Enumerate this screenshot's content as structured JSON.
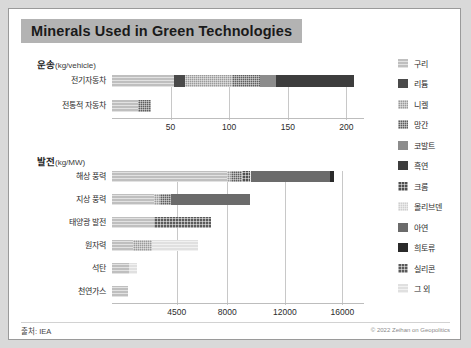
{
  "title": "Minerals Used in Green Technologies",
  "source": "출처: IEA",
  "copyright": "© 2022 Zeihan on Geopolitics",
  "legend": {
    "items": [
      {
        "label": "구리",
        "color": "#bfbfbf",
        "pattern": "hlines"
      },
      {
        "label": "리튬",
        "color": "#4a4a4a",
        "pattern": "solid"
      },
      {
        "label": "니켈",
        "color": "#9a9a9a",
        "pattern": "dots"
      },
      {
        "label": "망간",
        "color": "#5e5e5e",
        "pattern": "dots"
      },
      {
        "label": "코발트",
        "color": "#8c8c8c",
        "pattern": "solid"
      },
      {
        "label": "흑연",
        "color": "#3d3d3d",
        "pattern": "solid"
      },
      {
        "label": "크롬",
        "color": "#4f4f4f",
        "pattern": "checks"
      },
      {
        "label": "몰리브덴",
        "color": "#cfcfcf",
        "pattern": "dots"
      },
      {
        "label": "아연",
        "color": "#6b6b6b",
        "pattern": "solid"
      },
      {
        "label": "희토류",
        "color": "#2a2a2a",
        "pattern": "solid"
      },
      {
        "label": "실리콘",
        "color": "#5a5a5a",
        "pattern": "checks"
      },
      {
        "label": "그 외",
        "color": "#e0e0e0",
        "pattern": "hlines"
      }
    ]
  },
  "chart_data": [
    {
      "type": "bar",
      "orientation": "horizontal",
      "stacked": true,
      "title": "운송",
      "unit": "(kg/vehicle)",
      "xlabel": "",
      "ylabel": "",
      "xlim": [
        0,
        215
      ],
      "xticks": [
        50,
        100,
        150,
        200
      ],
      "xticklabels": [
        "50",
        "100",
        "150",
        "200"
      ],
      "grid": true,
      "categories": [
        "전기자동차",
        "전통적 자동차"
      ],
      "series": [
        {
          "name": "구리",
          "values": [
            53.2,
            22.3
          ]
        },
        {
          "name": "리튬",
          "values": [
            8.9,
            0
          ]
        },
        {
          "name": "니켈",
          "values": [
            39.9,
            0
          ]
        },
        {
          "name": "망간",
          "values": [
            24.5,
            11.2
          ]
        },
        {
          "name": "코발트",
          "values": [
            13.3,
            0
          ]
        },
        {
          "name": "흑연",
          "values": [
            66.3,
            0
          ]
        }
      ],
      "totals": [
        206.1,
        33.5
      ]
    },
    {
      "type": "bar",
      "orientation": "horizontal",
      "stacked": true,
      "title": "발전",
      "unit": "(kg/MW)",
      "xlabel": "",
      "ylabel": "",
      "xlim": [
        0,
        17500
      ],
      "xticks": [
        4500,
        8000,
        12000,
        16000
      ],
      "xticklabels": [
        "4500",
        "8000",
        "12000",
        "16000"
      ],
      "grid": true,
      "categories": [
        "해상 풍력",
        "지상 풍력",
        "태양광 발전",
        "원자력",
        "석탄",
        "천연가스"
      ],
      "series": [
        {
          "name": "구리",
          "values": [
            8000,
            2900,
            2900,
            1473,
            1150,
            1100
          ]
        },
        {
          "name": "니켈",
          "values": [
            240,
            404,
            0,
            1300,
            0,
            0
          ]
        },
        {
          "name": "망간",
          "values": [
            790,
            780,
            0,
            0,
            0,
            0
          ]
        },
        {
          "name": "크롬",
          "values": [
            525,
            0,
            0,
            0,
            0,
            0
          ]
        },
        {
          "name": "몰리브덴",
          "values": [
            109,
            0,
            0,
            0,
            0,
            0
          ]
        },
        {
          "name": "아연",
          "values": [
            5500,
            5500,
            0,
            0,
            0,
            0
          ]
        },
        {
          "name": "희토류",
          "values": [
            239,
            0,
            0,
            0,
            0,
            0
          ]
        },
        {
          "name": "실리콘",
          "values": [
            0,
            0,
            4000,
            0,
            0,
            0
          ]
        },
        {
          "name": "그 외",
          "values": [
            0,
            0,
            0,
            3200,
            600,
            0
          ]
        }
      ],
      "totals": [
        15403,
        9586,
        6900,
        5973,
        1750,
        1100
      ]
    }
  ]
}
